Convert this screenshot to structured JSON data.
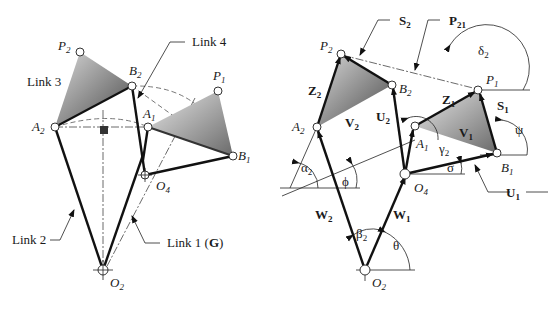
{
  "left_figure": {
    "title": "Four-bar linkage positions",
    "labels": {
      "link2": "Link 2",
      "link3": "Link 3",
      "link4": "Link 4",
      "link1": "Link 1 (",
      "link1_bold": "G",
      "link1_close": ")"
    },
    "points": {
      "P2": {
        "base": "P",
        "sub": "2"
      },
      "B2": {
        "base": "B",
        "sub": "2"
      },
      "A2": {
        "base": "A",
        "sub": "2"
      },
      "A1": {
        "base": "A",
        "sub": "1"
      },
      "P1": {
        "base": "P",
        "sub": "1"
      },
      "B1": {
        "base": "B",
        "sub": "1"
      },
      "O4": {
        "base": "O",
        "sub": "4"
      },
      "O2": {
        "base": "O",
        "sub": "2"
      }
    }
  },
  "right_figure": {
    "title": "Vector loop notation",
    "vectors": {
      "S2": {
        "base": "S",
        "sub": "2"
      },
      "P21": {
        "base": "P",
        "sub": "21"
      },
      "Z2": {
        "base": "Z",
        "sub": "2"
      },
      "V2": {
        "base": "V",
        "sub": "2"
      },
      "U2": {
        "base": "U",
        "sub": "2"
      },
      "Z1": {
        "base": "Z",
        "sub": "1"
      },
      "S1": {
        "base": "S",
        "sub": "1"
      },
      "V1": {
        "base": "V",
        "sub": "1"
      },
      "U1": {
        "base": "U",
        "sub": "1"
      },
      "W2": {
        "base": "W",
        "sub": "2"
      },
      "W1": {
        "base": "W",
        "sub": "1"
      }
    },
    "angles": {
      "delta2": {
        "base": "δ",
        "sub": "2"
      },
      "psi": {
        "base": "ψ",
        "sub": ""
      },
      "gamma2": {
        "base": "γ",
        "sub": "2"
      },
      "sigma": {
        "base": "σ",
        "sub": ""
      },
      "alpha2": {
        "base": "α",
        "sub": "2"
      },
      "phi": {
        "base": "ϕ",
        "sub": ""
      },
      "beta2": {
        "base": "β",
        "sub": "2"
      },
      "theta": {
        "base": "θ",
        "sub": ""
      }
    },
    "points": {
      "P2": {
        "base": "P",
        "sub": "2"
      },
      "B2": {
        "base": "B",
        "sub": "2"
      },
      "A2": {
        "base": "A",
        "sub": "2"
      },
      "A1": {
        "base": "A",
        "sub": "1"
      },
      "P1": {
        "base": "P",
        "sub": "1"
      },
      "B1": {
        "base": "B",
        "sub": "1"
      },
      "O4": {
        "base": "O",
        "sub": "4"
      },
      "O2": {
        "base": "O",
        "sub": "2"
      }
    }
  },
  "colors": {
    "link": "#111111",
    "coupler_dark": "#555555",
    "coupler_light": "#e6e6e6"
  }
}
